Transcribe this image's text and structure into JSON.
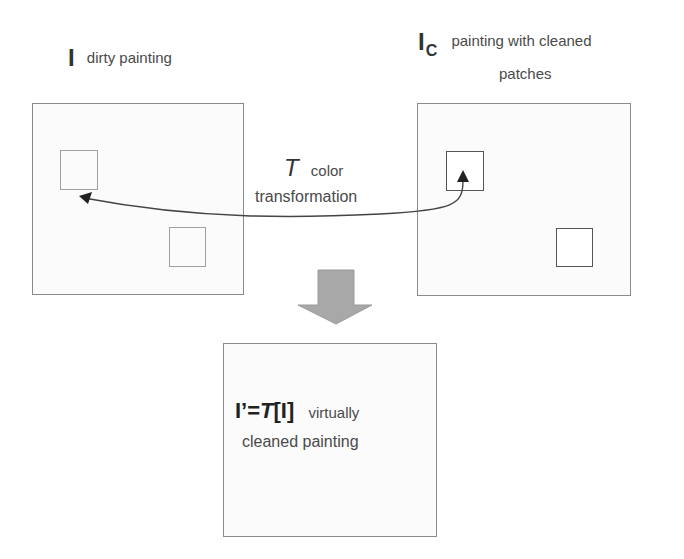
{
  "diagram": {
    "dirty_painting": {
      "symbol": "I",
      "label": "dirty painting"
    },
    "cleaned_patches_painting": {
      "symbol": "I",
      "subscript": "C",
      "label_line1": "painting with cleaned",
      "label_line2": "patches"
    },
    "transformation": {
      "symbol": "T",
      "label_line1": "color",
      "label_line2": "transformation"
    },
    "result": {
      "formula_lhs": "I’=",
      "formula_T": "T",
      "formula_arg": "[I]",
      "label_line1": "virtually",
      "label_line2": "cleaned painting"
    },
    "colors": {
      "box_border": "#8a8a8a",
      "clean_patch_border": "#555555",
      "down_arrow_fill": "#a8a8a8",
      "curve_arrow": "#333333"
    }
  }
}
